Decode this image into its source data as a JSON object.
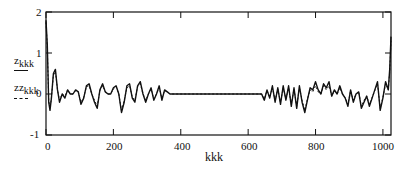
{
  "chart_data": {
    "type": "line",
    "title": "",
    "xlabel": "kkk",
    "ylabel_series": [
      "z_kkk",
      "zz_kkk"
    ],
    "xlim": [
      0,
      1024
    ],
    "ylim": [
      -1,
      2
    ],
    "x_ticks": [
      0,
      200,
      400,
      600,
      800,
      1000
    ],
    "y_ticks": [
      -1,
      0,
      1,
      2
    ],
    "grid": false,
    "legend_position": "left (stacked under y-axis labels)",
    "series": [
      {
        "name": "z_kkk",
        "style": "solid",
        "x": [
          0,
          4,
          8,
          12,
          16,
          22,
          28,
          34,
          40,
          48,
          56,
          64,
          72,
          80,
          88,
          96,
          104,
          112,
          120,
          128,
          136,
          144,
          152,
          160,
          168,
          176,
          184,
          192,
          200,
          208,
          216,
          224,
          232,
          240,
          248,
          256,
          264,
          272,
          280,
          288,
          296,
          304,
          312,
          320,
          328,
          336,
          344,
          352,
          360,
          368,
          380,
          640,
          648,
          656,
          664,
          672,
          680,
          688,
          696,
          704,
          712,
          720,
          728,
          736,
          744,
          752,
          760,
          768,
          776,
          784,
          792,
          800,
          808,
          816,
          824,
          832,
          840,
          848,
          856,
          864,
          872,
          880,
          888,
          896,
          904,
          912,
          920,
          928,
          936,
          944,
          952,
          960,
          968,
          976,
          984,
          992,
          1000,
          1008,
          1016,
          1020,
          1024
        ],
        "y": [
          1.8,
          1.2,
          -0.2,
          -0.4,
          -0.1,
          0.5,
          0.6,
          0.1,
          -0.2,
          0.0,
          -0.1,
          0.1,
          0.0,
          0.0,
          0.1,
          0.05,
          -0.25,
          -0.1,
          0.2,
          0.25,
          0.0,
          -0.2,
          -0.35,
          0.1,
          0.25,
          0.05,
          0.0,
          0.0,
          0.15,
          0.2,
          0.0,
          -0.45,
          -0.2,
          0.2,
          0.25,
          -0.1,
          -0.2,
          0.2,
          0.3,
          0.0,
          -0.2,
          0.0,
          0.15,
          -0.15,
          0.0,
          0.2,
          -0.15,
          0.1,
          0.05,
          0.0,
          0.0,
          0.0,
          -0.15,
          0.1,
          -0.1,
          0.2,
          -0.2,
          0.15,
          -0.25,
          0.2,
          -0.15,
          0.2,
          -0.3,
          0.15,
          -0.35,
          0.2,
          -0.2,
          -0.45,
          -0.15,
          0.15,
          0.1,
          0.3,
          0.1,
          0.0,
          0.25,
          0.15,
          0.3,
          -0.05,
          0.1,
          0.0,
          0.2,
          0.0,
          -0.1,
          -0.3,
          0.1,
          -0.2,
          0.0,
          0.05,
          -0.35,
          -0.2,
          -0.05,
          -0.3,
          -0.1,
          0.1,
          0.3,
          -0.4,
          -0.1,
          0.3,
          0.1,
          0.6,
          1.4
        ]
      },
      {
        "name": "zz_kkk",
        "style": "dashed",
        "x": [
          0,
          4,
          8,
          12,
          16,
          22,
          28,
          34,
          40,
          48,
          56,
          64,
          72,
          80,
          88,
          96,
          104,
          112,
          120,
          128,
          136,
          144,
          152,
          160,
          168,
          176,
          184,
          192,
          200,
          208,
          216,
          224,
          232,
          240,
          248,
          256,
          264,
          272,
          280,
          288,
          296,
          304,
          312,
          320,
          328,
          336,
          344,
          352,
          360,
          368,
          380,
          640,
          648,
          656,
          664,
          672,
          680,
          688,
          696,
          704,
          712,
          720,
          728,
          736,
          744,
          752,
          760,
          768,
          776,
          784,
          792,
          800,
          808,
          816,
          824,
          832,
          840,
          848,
          856,
          864,
          872,
          880,
          888,
          896,
          904,
          912,
          920,
          928,
          936,
          944,
          952,
          960,
          968,
          976,
          984,
          992,
          1000,
          1008,
          1016,
          1020,
          1024
        ],
        "y": [
          1.75,
          1.15,
          -0.15,
          -0.35,
          -0.1,
          0.45,
          0.55,
          0.1,
          -0.15,
          0.0,
          -0.05,
          0.1,
          0.0,
          0.0,
          0.08,
          0.05,
          -0.2,
          -0.08,
          0.18,
          0.2,
          0.0,
          -0.15,
          -0.3,
          0.08,
          0.2,
          0.05,
          0.0,
          0.0,
          0.12,
          0.18,
          0.0,
          -0.4,
          -0.15,
          0.15,
          0.2,
          -0.08,
          -0.15,
          0.18,
          0.25,
          0.0,
          -0.15,
          0.0,
          0.12,
          -0.12,
          0.0,
          0.15,
          -0.1,
          0.08,
          0.05,
          0.0,
          0.0,
          0.0,
          -0.12,
          0.08,
          -0.08,
          0.15,
          -0.15,
          0.12,
          -0.2,
          0.15,
          -0.12,
          0.15,
          -0.25,
          0.12,
          -0.3,
          0.15,
          -0.15,
          -0.4,
          -0.12,
          0.1,
          0.05,
          0.2,
          0.05,
          0.0,
          0.2,
          0.1,
          0.2,
          -0.05,
          0.08,
          0.0,
          0.15,
          0.0,
          -0.08,
          -0.25,
          0.08,
          -0.15,
          0.0,
          0.05,
          -0.3,
          -0.15,
          -0.05,
          -0.25,
          -0.08,
          0.08,
          0.25,
          -0.35,
          -0.08,
          0.25,
          0.1,
          0.55,
          1.3
        ]
      }
    ]
  },
  "axes": {
    "y_tick_labels": [
      "2",
      "1",
      "0",
      "-1"
    ],
    "x_tick_labels": [
      "0",
      "200",
      "400",
      "600",
      "800",
      "1000"
    ],
    "xlabel": "kkk",
    "series_labels": [
      {
        "base": "z",
        "sub": "kkk",
        "legend": "solid"
      },
      {
        "base": "zz",
        "sub": "kkk",
        "legend": "dashed"
      }
    ]
  }
}
